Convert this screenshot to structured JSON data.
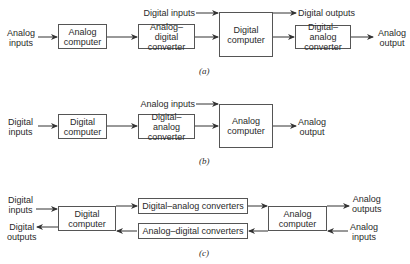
{
  "panel_a": {
    "caption": "(a)",
    "analog_inputs": "Analog\ninputs",
    "analog_computer": "Analog\ncomputer",
    "adc": "Analog–digital\nconverter",
    "digital_inputs": "Digital inputs",
    "digital_computer": "Digital\ncomputer",
    "digital_outputs": "Digital outputs",
    "dac": "Digital–analog\nconverter",
    "analog_output": "Analog\noutput"
  },
  "panel_b": {
    "caption": "(b)",
    "digital_inputs": "Digital\ninputs",
    "digital_computer": "Digital\ncomputer",
    "dac": "Digital–analog\nconverter",
    "analog_inputs": "Analog inputs",
    "analog_computer": "Analog\ncomputer",
    "analog_output": "Analog\noutput"
  },
  "panel_c": {
    "caption": "(c)",
    "digital_inputs": "Digital\ninputs",
    "digital_outputs": "Digital\noutputs",
    "digital_computer": "Digital\ncomputer",
    "dac": "Digital–analog converters",
    "adc": "Analog–digital converters",
    "analog_computer": "Analog\ncomputer",
    "analog_outputs": "Analog\noutputs",
    "analog_inputs": "Analog\ninputs"
  }
}
